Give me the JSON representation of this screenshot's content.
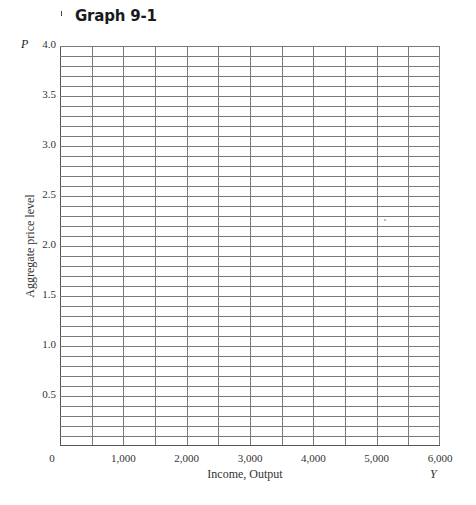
{
  "chart_data": {
    "type": "line",
    "title": "Graph 9-1",
    "xlabel": "Income, Output",
    "x_symbol": "Y",
    "ylabel": "Aggregate price level",
    "y_symbol": "P",
    "xlim": [
      0,
      6000
    ],
    "ylim": [
      0,
      4.0
    ],
    "x_ticks": [
      "0",
      "1,000",
      "2,000",
      "3,000",
      "4,000",
      "5,000",
      "6,000"
    ],
    "y_ticks": [
      "0.5",
      "1.0",
      "1.5",
      "2.0",
      "2.5",
      "3.0",
      "3.5",
      "4.0"
    ],
    "x_tick_values": [
      0,
      1000,
      2000,
      3000,
      4000,
      5000,
      6000
    ],
    "y_tick_values": [
      0.5,
      1.0,
      1.5,
      2.0,
      2.5,
      3.0,
      3.5,
      4.0
    ],
    "grid": true,
    "grid_x_step": 500,
    "grid_y_step": 0.1,
    "series": []
  },
  "style": {
    "grid_color": "#7a7a7a",
    "axis_color": "#555555",
    "text_color": "#333333"
  }
}
